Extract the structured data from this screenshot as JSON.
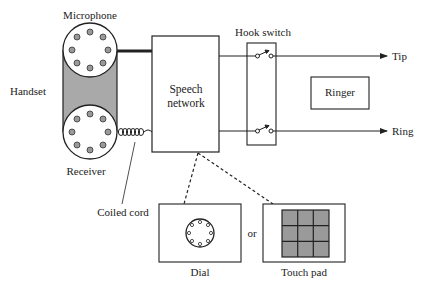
{
  "diagram": {
    "labels": {
      "microphone": "Microphone",
      "handset": "Handset",
      "receiver": "Receiver",
      "coiled_cord": "Coiled cord",
      "speech_network_line1": "Speech",
      "speech_network_line2": "network",
      "hook_switch": "Hook switch",
      "ringer": "Ringer",
      "tip": "Tip",
      "ring": "Ring",
      "or": "or",
      "dial": "Dial",
      "touch_pad": "Touch pad"
    },
    "colors": {
      "stroke": "#222222",
      "handset_fill": "#a9a9a9",
      "hole_fill": "#999999",
      "keypad_fill": "#9a9a9a"
    },
    "nodes": [
      {
        "id": "microphone",
        "type": "circle"
      },
      {
        "id": "receiver",
        "type": "circle"
      },
      {
        "id": "speech_network",
        "type": "box"
      },
      {
        "id": "hook_switch",
        "type": "box"
      },
      {
        "id": "ringer",
        "type": "box"
      },
      {
        "id": "dial",
        "type": "box"
      },
      {
        "id": "touch_pad",
        "type": "box"
      }
    ],
    "edges": [
      {
        "from": "microphone",
        "to": "speech_network",
        "style": "thick"
      },
      {
        "from": "receiver",
        "to": "speech_network",
        "style": "coiled"
      },
      {
        "from": "speech_network",
        "to": "hook_switch",
        "label": "upper"
      },
      {
        "from": "speech_network",
        "to": "hook_switch",
        "label": "lower"
      },
      {
        "from": "hook_switch",
        "to": "tip",
        "style": "arrow"
      },
      {
        "from": "hook_switch",
        "to": "ring",
        "style": "arrow"
      },
      {
        "from": "speech_network",
        "to": "dial",
        "style": "dashed"
      },
      {
        "from": "speech_network",
        "to": "touch_pad",
        "style": "dashed"
      }
    ]
  }
}
